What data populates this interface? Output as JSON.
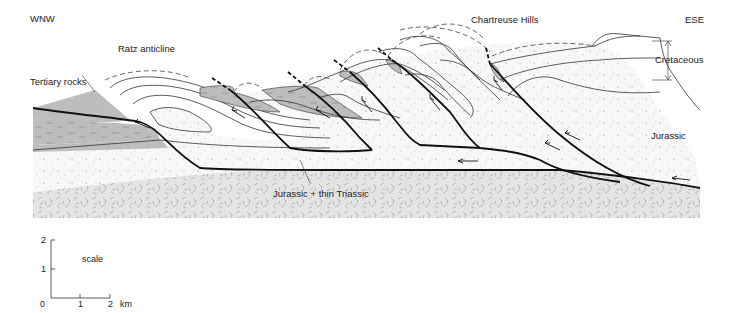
{
  "figure": {
    "type": "geological cross-section",
    "orientation": {
      "left": "WNW",
      "right": "ESE"
    },
    "labels": {
      "ratz_anticline": "Ratz anticline",
      "chartreuse_hills": "Chartreuse Hills",
      "tertiary_rocks": "Tertiary rocks",
      "cretaceous": "Cretaceous",
      "jurassic": "Jurassic",
      "basement": "Jurassic + thin Triassic"
    },
    "units": [
      {
        "name": "Tertiary rocks",
        "pattern": "grey fill with dashes",
        "color": "#bdbdbd"
      },
      {
        "name": "Cretaceous",
        "pattern": "white banded layers",
        "color": "#ffffff"
      },
      {
        "name": "Jurassic",
        "pattern": "stippled",
        "color": "#f6f6f6"
      },
      {
        "name": "Jurassic + thin Triassic",
        "pattern": "random ticks",
        "color": "#e6e6e6"
      }
    ],
    "colors": {
      "tertiary": "#bdbdbd",
      "jurassic": "#f7f7f7",
      "basement": "#e4e4e4",
      "fault": "#111111",
      "bed": "#333333"
    }
  },
  "scale": {
    "title": "scale",
    "y_ticks": [
      "0",
      "1",
      "2"
    ],
    "x_ticks": [
      "1",
      "2"
    ],
    "x_unit": "km"
  }
}
